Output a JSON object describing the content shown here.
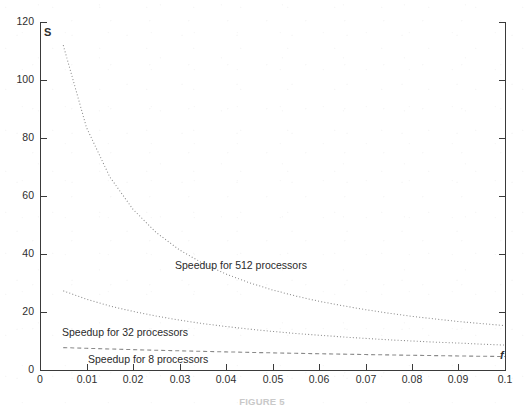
{
  "figure": {
    "caption": "FIGURE 5",
    "y_axis_symbol": "S",
    "x_axis_symbol": "f"
  },
  "chart_data": {
    "type": "line",
    "title": "",
    "subtitle": "",
    "xlabel": "f",
    "ylabel": "S",
    "xlim": [
      0,
      0.1
    ],
    "ylim": [
      0,
      120
    ],
    "grid": false,
    "legend_position": "inline-annotations",
    "x_ticks": [
      "0",
      "0.01",
      "0.02",
      "0.03",
      "0.04",
      "0.05",
      "0.06",
      "0.07",
      "0.08",
      "0.09",
      "0.1"
    ],
    "x_tick_values": [
      0,
      0.01,
      0.02,
      0.03,
      0.04,
      0.05,
      0.06,
      0.07,
      0.08,
      0.09,
      0.1
    ],
    "y_ticks": [
      "0",
      "20",
      "40",
      "60",
      "80",
      "100",
      "120"
    ],
    "y_tick_values": [
      0,
      20,
      40,
      60,
      80,
      100,
      120
    ],
    "x": [
      0.005,
      0.01,
      0.015,
      0.02,
      0.025,
      0.03,
      0.035,
      0.04,
      0.045,
      0.05,
      0.055,
      0.06,
      0.065,
      0.07,
      0.075,
      0.08,
      0.085,
      0.09,
      0.095,
      0.1
    ],
    "series": [
      {
        "name": "Speedup for 512 processors",
        "style": "dotted",
        "annotation": "Speedup for 512 processors",
        "values": [
          112.0,
          83.6,
          66.6,
          55.4,
          47.4,
          41.4,
          36.8,
          33.1,
          30.1,
          27.6,
          25.5,
          23.7,
          22.2,
          20.8,
          19.6,
          18.5,
          17.6,
          16.7,
          16.0,
          15.3
        ]
      },
      {
        "name": "Speedup for 32 processors",
        "style": "dotted",
        "annotation": "Speedup for 32 processors",
        "values": [
          27.3,
          24.4,
          22.1,
          20.2,
          18.6,
          17.2,
          16.0,
          15.0,
          14.1,
          13.3,
          12.6,
          12.0,
          11.4,
          10.9,
          10.4,
          10.0,
          9.6,
          9.3,
          8.9,
          8.6
        ]
      },
      {
        "name": "Speedup for 8 processors",
        "style": "dashed",
        "annotation": "Speedup for 8 processors",
        "values": [
          7.73,
          7.48,
          7.25,
          7.02,
          6.81,
          6.61,
          6.42,
          6.25,
          6.08,
          5.91,
          5.76,
          5.61,
          5.47,
          5.33,
          5.2,
          5.08,
          4.96,
          4.85,
          4.74,
          4.64
        ]
      }
    ],
    "annotations": [
      {
        "text": "Speedup for 512 processors",
        "x": 0.03,
        "y": 31
      },
      {
        "text": "Speedup for 32 processors",
        "x": 0.006,
        "y": 14
      },
      {
        "text": "Speedup for 8 processors",
        "x": 0.012,
        "y": 4.5
      }
    ]
  },
  "colors": {
    "axis": "#3a3a3a",
    "curve": "#8a8a8a",
    "text": "#2b2b2b",
    "caption": "#c9c9c9",
    "background": "#ffffff"
  }
}
